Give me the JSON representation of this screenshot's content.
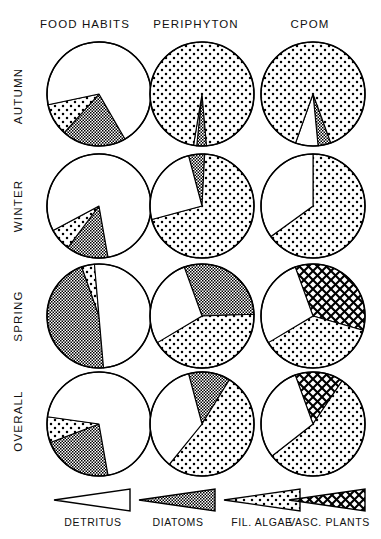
{
  "figure": {
    "title": "",
    "columns": [
      {
        "id": "food_habits",
        "label": "FOOD HABITS"
      },
      {
        "id": "periphyton",
        "label": "PERIPHYTON"
      },
      {
        "id": "cpom",
        "label": "CPOM"
      }
    ],
    "rows": [
      {
        "id": "autumn",
        "label": "AUTUMN"
      },
      {
        "id": "winter",
        "label": "WINTER"
      },
      {
        "id": "spring",
        "label": "SPRING"
      },
      {
        "id": "overall",
        "label": "OVERALL"
      }
    ],
    "legend": [
      {
        "id": "detritus",
        "label": "DETRITUS",
        "pattern": "white"
      },
      {
        "id": "diatoms",
        "label": "DIATOMS",
        "pattern": "dense-check-gray"
      },
      {
        "id": "fil_algae",
        "label": "FIL. ALGAE",
        "pattern": "sparse-dots"
      },
      {
        "id": "vasc_plants",
        "label": "VASC. PLANTS",
        "pattern": "cross-hatch"
      }
    ]
  },
  "chart_data": {
    "type": "pie",
    "xlabel": "",
    "ylabel": "",
    "legend_position": "bottom",
    "grid": false,
    "units": "percent",
    "categories": [
      "DETRITUS",
      "DIATOMS",
      "FIL. ALGAE",
      "VASC. PLANTS"
    ],
    "category_patterns": [
      "white",
      "dense-check-gray",
      "sparse-dots",
      "cross-hatch"
    ],
    "panel_rows": [
      "AUTUMN",
      "WINTER",
      "SPRING",
      "OVERALL"
    ],
    "panel_columns": [
      "FOOD HABITS",
      "PERIPHYTON",
      "CPOM"
    ],
    "panels": [
      {
        "row": "AUTUMN",
        "column": "FOOD HABITS",
        "values": {
          "DETRITUS": 70,
          "DIATOMS": 20,
          "FIL. ALGAE": 10,
          "VASC. PLANTS": 0
        }
      },
      {
        "row": "AUTUMN",
        "column": "PERIPHYTON",
        "values": {
          "DETRITUS": 1,
          "DIATOMS": 3,
          "FIL. ALGAE": 96,
          "VASC. PLANTS": 0
        }
      },
      {
        "row": "AUTUMN",
        "column": "CPOM",
        "values": {
          "DETRITUS": 7,
          "DIATOMS": 4,
          "FIL. ALGAE": 89,
          "VASC. PLANTS": 0
        }
      },
      {
        "row": "WINTER",
        "column": "FOOD HABITS",
        "values": {
          "DETRITUS": 80,
          "DIATOMS": 13,
          "FIL. ALGAE": 7,
          "VASC. PLANTS": 0
        }
      },
      {
        "row": "WINTER",
        "column": "PERIPHYTON",
        "values": {
          "DETRITUS": 25,
          "DIATOMS": 5,
          "FIL. ALGAE": 70,
          "VASC. PLANTS": 0
        }
      },
      {
        "row": "WINTER",
        "column": "CPOM",
        "values": {
          "DETRITUS": 35,
          "DIATOMS": 0,
          "FIL. ALGAE": 65,
          "VASC. PLANTS": 0
        }
      },
      {
        "row": "SPRING",
        "column": "FOOD HABITS",
        "values": {
          "DETRITUS": 50,
          "DIATOMS": 46,
          "FIL. ALGAE": 4,
          "VASC. PLANTS": 0
        }
      },
      {
        "row": "SPRING",
        "column": "PERIPHYTON",
        "values": {
          "DETRITUS": 28,
          "DIATOMS": 30,
          "FIL. ALGAE": 42,
          "VASC. PLANTS": 0
        }
      },
      {
        "row": "SPRING",
        "column": "CPOM",
        "values": {
          "DETRITUS": 28,
          "DIATOMS": 0,
          "FIL. ALGAE": 37,
          "VASC. PLANTS": 35
        }
      },
      {
        "row": "OVERALL",
        "column": "FOOD HABITS",
        "values": {
          "DETRITUS": 70,
          "DIATOMS": 22,
          "FIL. ALGAE": 8,
          "VASC. PLANTS": 0
        }
      },
      {
        "row": "OVERALL",
        "column": "PERIPHYTON",
        "values": {
          "DETRITUS": 35,
          "DIATOMS": 13,
          "FIL. ALGAE": 52,
          "VASC. PLANTS": 0
        }
      },
      {
        "row": "OVERALL",
        "column": "CPOM",
        "values": {
          "DETRITUS": 30,
          "DIATOMS": 0,
          "FIL. ALGAE": 55,
          "VASC. PLANTS": 15
        }
      }
    ]
  },
  "colors": {
    "ink": "#000000",
    "paper": "#ffffff",
    "diatom_gray": "#808080"
  }
}
